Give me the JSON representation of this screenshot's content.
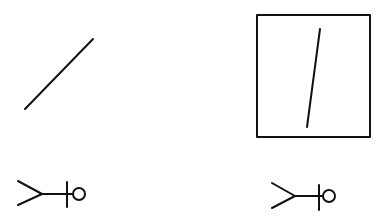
{
  "diagram": {
    "width": 390,
    "height": 223,
    "background": "#ffffff",
    "ink": "#111111",
    "figures": [
      {
        "name": "free-diagonal-line",
        "type": "line",
        "x1": 25,
        "y1": 109,
        "x2": 93,
        "y2": 39,
        "stroke_width": 2
      },
      {
        "name": "framed-line",
        "frame": {
          "x": 257,
          "y": 15,
          "width": 113,
          "height": 122,
          "stroke_width": 2
        },
        "line": {
          "x1": 320,
          "y1": 29,
          "x2": 307,
          "y2": 127,
          "stroke_width": 2
        }
      }
    ],
    "symbols": [
      {
        "name": "symbol-left",
        "fork_upper": {
          "x1": 18,
          "y1": 181,
          "x2": 42,
          "y2": 194
        },
        "fork_lower": {
          "x1": 18,
          "y1": 205,
          "x2": 42,
          "y2": 194
        },
        "stem": {
          "x1": 42,
          "y1": 194,
          "x2": 73,
          "y2": 194
        },
        "tick": {
          "x1": 67,
          "y1": 182,
          "x2": 67,
          "y2": 207
        },
        "circle": {
          "cx": 79,
          "cy": 194,
          "r": 6
        }
      },
      {
        "name": "symbol-right",
        "fork_upper": {
          "x1": 272,
          "y1": 183,
          "x2": 295,
          "y2": 196
        },
        "fork_lower": {
          "x1": 272,
          "y1": 208,
          "x2": 295,
          "y2": 196
        },
        "stem": {
          "x1": 295,
          "y1": 196,
          "x2": 323,
          "y2": 196
        },
        "tick": {
          "x1": 319,
          "y1": 185,
          "x2": 319,
          "y2": 210
        },
        "circle": {
          "cx": 329,
          "cy": 196,
          "r": 6
        }
      }
    ]
  }
}
